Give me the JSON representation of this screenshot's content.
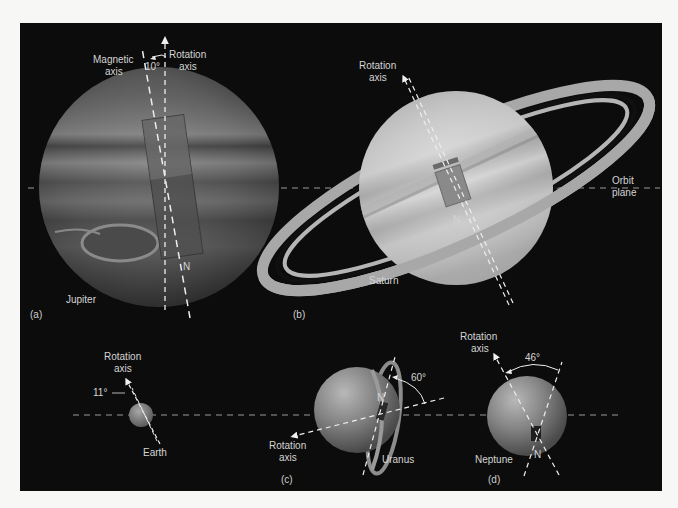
{
  "figure": {
    "background": "#0c0c0c",
    "page_background": "#f7f7f5",
    "line_color": "#e6e6e6"
  },
  "panels": [
    {
      "id": "a",
      "letter": "(a)",
      "planet": "Jupiter",
      "labels": {
        "magnetic_axis_line1": "Magnetic",
        "magnetic_axis_line2": "axis",
        "rotation_axis_line1": "Rotation",
        "rotation_axis_line2": "axis",
        "angle": "10°",
        "north": "N"
      }
    },
    {
      "id": "b",
      "letter": "(b)",
      "planet": "Saturn",
      "labels": {
        "rotation_axis_line1": "Rotation",
        "rotation_axis_line2": "axis",
        "orbit_plane_line1": "Orbit",
        "orbit_plane_line2": "plane",
        "north": "N"
      }
    },
    {
      "id": "c",
      "letter": "(c)",
      "planets": [
        "Earth",
        "Uranus"
      ],
      "labels": {
        "earth_rotation_line1": "Rotation",
        "earth_rotation_line2": "axis",
        "earth_angle": "11°",
        "uranus_rotation_line1": "Rotation",
        "uranus_rotation_line2": "axis",
        "uranus_angle": "60°",
        "north": "N"
      }
    },
    {
      "id": "d",
      "letter": "(d)",
      "planet": "Neptune",
      "labels": {
        "rotation_axis_line1": "Rotation",
        "rotation_axis_line2": "axis",
        "angle": "46°",
        "north": "N"
      }
    }
  ]
}
